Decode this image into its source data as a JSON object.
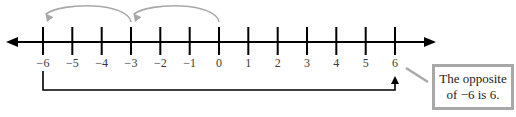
{
  "diagram": {
    "type": "number-line",
    "min": -6,
    "max": 6,
    "ticks": [
      "−6",
      "−5",
      "−4",
      "−3",
      "−2",
      "−1",
      "0",
      "1",
      "2",
      "3",
      "4",
      "5",
      "6"
    ],
    "arcs": [
      {
        "from": 0,
        "to": -3,
        "color": "#a8a8a8"
      },
      {
        "from": -3,
        "to": -6,
        "color": "#a8a8a8"
      }
    ],
    "bracket": {
      "from": -6,
      "to": 6,
      "color": "#000000"
    },
    "callout": {
      "line1": "The opposite",
      "line2": "of −6 is 6.",
      "border_color": "#a8a8a8"
    },
    "colors": {
      "axis": "#000000",
      "arc": "#a8a8a8",
      "label": "#3a3a3a"
    }
  }
}
